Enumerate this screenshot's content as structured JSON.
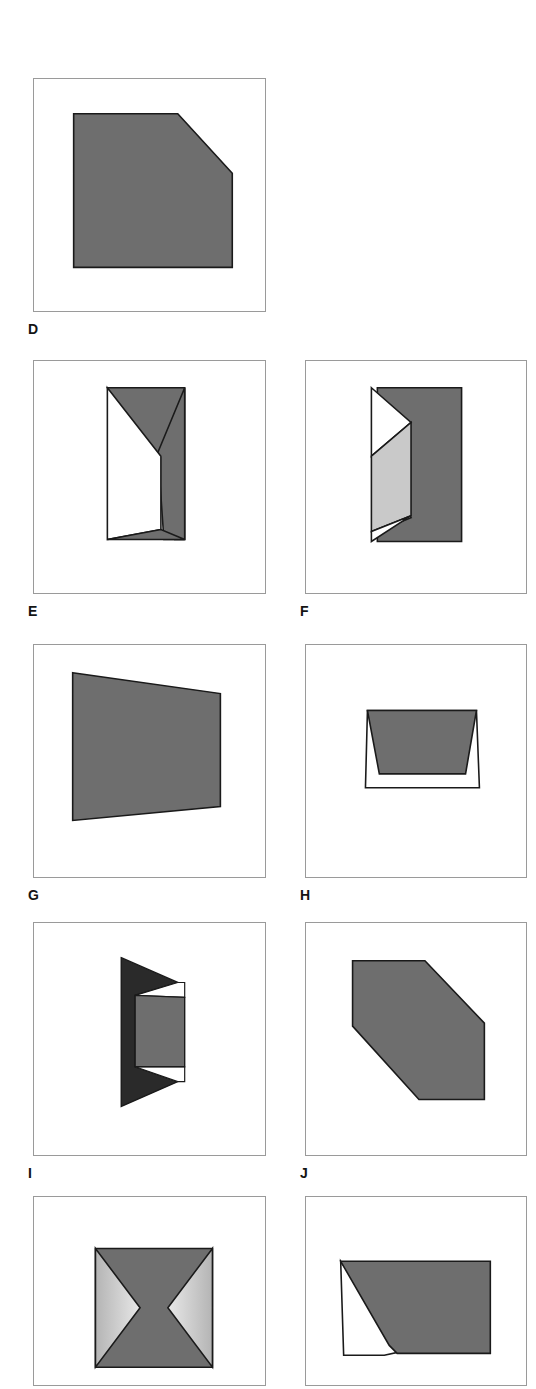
{
  "figure": {
    "title": "",
    "background_color": "#ffffff",
    "panel_border_color": "#9a9a9a",
    "stroke_color": "#1a1a1a",
    "fill_dark": "#6e6e6e",
    "fill_darker": "#2a2a2a",
    "fill_light": "#c9c9c9",
    "fill_white": "#ffffff",
    "gradient_light": "#e8e8e8",
    "gradient_mid": "#b4b4b4"
  },
  "panels": [
    {
      "id": "panel-d",
      "label": "D",
      "description": "Solid dark pentagon with a chamfered upper-right corner",
      "x": 33,
      "y": 78,
      "w": 233,
      "h": 234,
      "label_x": 28,
      "label_y": 322,
      "shapes": [
        {
          "name": "chamfered-pentagon",
          "points": "40,35 145,35 200,95 200,190 40,190",
          "fill": "#6e6e6e",
          "stroke": "#1a1a1a",
          "stroke_width": 1.6
        }
      ]
    },
    {
      "id": "panel-e",
      "label": "E",
      "description": "Folded rectangle: dark right band with white triangular fold opening to the left",
      "x": 33,
      "y": 360,
      "w": 233,
      "h": 234,
      "label_x": 28,
      "label_y": 604,
      "shapes": [
        {
          "name": "dark-fold-band",
          "points": "74,27 152,27 152,180 142,180 142,172 74,27",
          "fill": "#6e6e6e",
          "stroke": "#1a1a1a",
          "stroke_width": 1.6
        },
        {
          "name": "dark-right-column",
          "points": "125,92 152,27 152,180 131,180",
          "fill": "#6e6e6e",
          "stroke": "#1a1a1a",
          "stroke_width": 1.6
        },
        {
          "name": "white-fold-face",
          "points": "74,27 128,96 128,170 74,180",
          "fill": "#ffffff",
          "stroke": "#1a1a1a",
          "stroke_width": 1.6
        },
        {
          "name": "dark-bottom-sliver",
          "points": "74,180 128,170 152,180",
          "fill": "#6e6e6e",
          "stroke": "#1a1a1a",
          "stroke_width": 1.6
        }
      ]
    },
    {
      "id": "panel-f",
      "label": "F",
      "description": "Folded sheet with dark back panel, light grey middle flap and small white triangles top and bottom",
      "x": 305,
      "y": 360,
      "w": 222,
      "h": 234,
      "label_x": 300,
      "label_y": 604,
      "shapes": [
        {
          "name": "dark-back-panel",
          "points": "72,27 157,27 157,182 72,182 72,172 106,158 72,112",
          "fill": "#6e6e6e",
          "stroke": "#1a1a1a",
          "stroke_width": 1.6
        },
        {
          "name": "white-top-triangle",
          "points": "66,27 106,62 66,96",
          "fill": "#ffffff",
          "stroke": "#1a1a1a",
          "stroke_width": 1.6
        },
        {
          "name": "light-middle-flap",
          "points": "66,96 106,62 106,156 66,172",
          "fill": "#c9c9c9",
          "stroke": "#1a1a1a",
          "stroke_width": 1.6
        },
        {
          "name": "white-bottom-triangle",
          "points": "66,172 106,156 66,182",
          "fill": "#ffffff",
          "stroke": "#1a1a1a",
          "stroke_width": 1.6
        }
      ]
    },
    {
      "id": "panel-g",
      "label": "G",
      "description": "Solid dark quadrilateral filling most of the frame, slightly skewed",
      "x": 33,
      "y": 644,
      "w": 233,
      "h": 234,
      "label_x": 28,
      "label_y": 888,
      "shapes": [
        {
          "name": "skewed-quadrilateral",
          "points": "39,28 188,49 188,163 39,177",
          "fill": "#6e6e6e",
          "stroke": "#1a1a1a",
          "stroke_width": 1.6
        }
      ]
    },
    {
      "id": "panel-h",
      "label": "H",
      "description": "Wide white triangle outline with a dark trapezoid nested inside",
      "x": 305,
      "y": 644,
      "w": 222,
      "h": 234,
      "label_x": 300,
      "label_y": 888,
      "shapes": [
        {
          "name": "white-outer-triangle",
          "points": "60,144 62,66 172,66 175,144",
          "fill": "#ffffff",
          "stroke": "#1a1a1a",
          "stroke_width": 1.6
        },
        {
          "name": "dark-inner-trapezoid",
          "points": "62,66 172,66 161,130 74,130",
          "fill": "#6e6e6e",
          "stroke": "#1a1a1a",
          "stroke_width": 1.6
        }
      ]
    },
    {
      "id": "panel-i",
      "label": "I",
      "description": "Narrow folded sheet: very dark outer triangles with a mid-grey front face and white gaps",
      "x": 33,
      "y": 922,
      "w": 233,
      "h": 234,
      "label_x": 28,
      "label_y": 1166,
      "shapes": [
        {
          "name": "very-dark-back-wing",
          "points": "88,35 145,60 102,73 102,145 145,160 88,185",
          "fill": "#2a2a2a",
          "stroke": "#1a1a1a",
          "stroke_width": 1.4
        },
        {
          "name": "white-upper-gap",
          "points": "145,60 152,60 152,75 102,73",
          "fill": "#ffffff",
          "stroke": "#1a1a1a",
          "stroke_width": 1.2
        },
        {
          "name": "white-lower-gap",
          "points": "102,145 152,145 152,160 145,160",
          "fill": "#ffffff",
          "stroke": "#1a1a1a",
          "stroke_width": 1.2
        },
        {
          "name": "mid-grey-front-face",
          "points": "102,73 152,75 152,145 102,145",
          "fill": "#6e6e6e",
          "stroke": "#1a1a1a",
          "stroke_width": 1.4
        }
      ]
    },
    {
      "id": "panel-j",
      "label": "J",
      "description": "Solid dark hexagon with chamfered upper-left, upper-right and lower-left corners",
      "x": 305,
      "y": 922,
      "w": 222,
      "h": 234,
      "label_x": 300,
      "label_y": 1166,
      "shapes": [
        {
          "name": "chamfered-hexagon",
          "points": "47,38 120,38 180,101 180,178 114,178 47,104",
          "fill": "#6e6e6e",
          "stroke": "#1a1a1a",
          "stroke_width": 1.6
        }
      ]
    },
    {
      "id": "panel-k",
      "label": "",
      "description": "Square with a dark hourglass/bowtie through the centre and gradient-shaded side triangles",
      "x": 33,
      "y": 1196,
      "w": 233,
      "h": 190,
      "label_x": 0,
      "label_y": 0,
      "shapes": [
        {
          "name": "dark-square-base",
          "points": "62,52 180,52 180,172 62,172",
          "fill": "#6e6e6e",
          "stroke": "#1a1a1a",
          "stroke_width": 1.6
        },
        {
          "name": "left-gradient-triangle",
          "points": "62,52 107,112 62,172",
          "fill": "gradient-left",
          "stroke": "#1a1a1a",
          "stroke_width": 1.6
        },
        {
          "name": "right-gradient-triangle",
          "points": "180,52 135,112 180,172",
          "fill": "gradient-right",
          "stroke": "#1a1a1a",
          "stroke_width": 1.6
        }
      ]
    },
    {
      "id": "panel-l",
      "label": "",
      "description": "Wide quadrilateral with a dark upper-right region and a white triangular flap on the lower left",
      "x": 305,
      "y": 1196,
      "w": 222,
      "h": 190,
      "label_x": 0,
      "label_y": 0,
      "shapes": [
        {
          "name": "white-lower-left-flap",
          "points": "35,65 97,156 79,160 38,160",
          "fill": "#ffffff",
          "stroke": "#1a1a1a",
          "stroke_width": 1.6
        },
        {
          "name": "dark-upper-right-region",
          "points": "35,65 186,65 186,158 92,158 84,150",
          "fill": "#6e6e6e",
          "stroke": "#1a1a1a",
          "stroke_width": 1.6
        }
      ]
    }
  ]
}
